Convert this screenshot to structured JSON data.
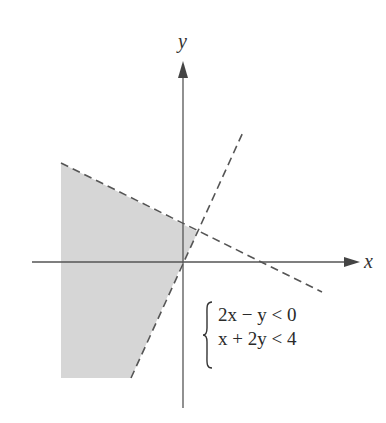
{
  "diagram": {
    "type": "inequality-system-graph",
    "axes": {
      "x_label": "x",
      "y_label": "y"
    },
    "system": {
      "inequalities": [
        "2x − y < 0",
        "x + 2y < 4"
      ]
    },
    "boundary_lines": [
      {
        "equation": "2x − y = 0",
        "style": "dashed"
      },
      {
        "equation": "x + 2y = 4",
        "style": "dashed"
      }
    ],
    "shaded_region": {
      "description": "region satisfying both inequalities",
      "color": "#d6d6d6"
    },
    "colors": {
      "axis": "#555555",
      "boundary": "#555555",
      "shade": "#d6d6d6"
    }
  }
}
